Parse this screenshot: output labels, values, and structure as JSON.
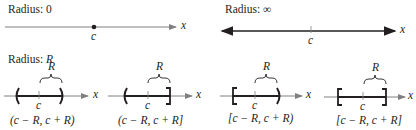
{
  "panels": {
    "radius_zero": {
      "label_prefix": "Radius: ",
      "label_value": "0",
      "center_label": "c",
      "axis_label": "x"
    },
    "radius_infinity": {
      "label_prefix": "Radius: ",
      "label_value": "∞",
      "center_label": "c",
      "axis_label": "x"
    },
    "radius_r": {
      "label_prefix": "Radius: ",
      "label_value": "R",
      "intervals": [
        {
          "brace_label": "R",
          "center_label": "c",
          "axis_label": "x",
          "notation": "(c − R, c + R)",
          "left": "(",
          "right": ")"
        },
        {
          "brace_label": "R",
          "center_label": "c",
          "axis_label": "x",
          "notation": "(c − R, c + R]",
          "left": "(",
          "right": "]"
        },
        {
          "brace_label": "R",
          "center_label": "c",
          "axis_label": "x",
          "notation": "[c − R, c + R)",
          "left": "[",
          "right": ")"
        },
        {
          "brace_label": "R",
          "center_label": "c",
          "axis_label": "x",
          "notation": "[c − R, c + R]",
          "left": "[",
          "right": "]"
        }
      ]
    }
  },
  "colors": {
    "ink": "#231f20",
    "axis": "#808080"
  }
}
